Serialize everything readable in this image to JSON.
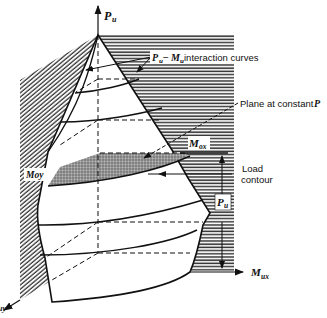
{
  "figure": {
    "type": "3D biaxial interaction surface (failure surface) diagram",
    "axes": {
      "vertical": {
        "symbol": "P",
        "subscript": "u"
      },
      "x": {
        "symbol": "M",
        "subscript": "ux"
      },
      "y": {
        "symbol": "M",
        "subscript": "uy",
        "visible_text": "uy"
      }
    },
    "labels": {
      "interaction_curves": {
        "p": "P",
        "p_sub": "u",
        "dash": " −",
        "m": "M",
        "m_sub": "u",
        "text": " interaction curves"
      },
      "plane": {
        "text": "Plane at constant ",
        "p": "P"
      },
      "mox": {
        "m": "M",
        "sub": "ox"
      },
      "moy": {
        "text": "Moy"
      },
      "load_contour": {
        "line1": "Load",
        "line2": "contour"
      },
      "pu_dim": {
        "p": "P",
        "sub": "u"
      }
    },
    "colors": {
      "ink": "#111111",
      "hatch": "#3a3a3a",
      "shaded_plane": "#8a8a8a",
      "background": "#ffffff"
    }
  }
}
